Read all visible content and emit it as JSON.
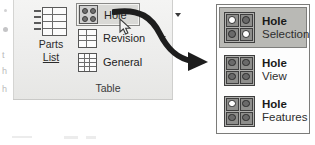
{
  "app": {
    "edge_fragments": [
      "t",
      "h",
      "h"
    ]
  },
  "ribbon": {
    "group_label": "Table",
    "parts_list": {
      "label_line1": "Parts",
      "label_line2": "List",
      "icon": "table-grid-icon"
    },
    "items": [
      {
        "label": "Hole",
        "icon": "hole-matrix-icon",
        "selected": true,
        "has_split_caret": true
      },
      {
        "label": "Revision",
        "icon": "revision-table-icon",
        "selected": false,
        "has_split_caret": true
      },
      {
        "label": "General",
        "icon": "general-table-icon",
        "selected": false,
        "has_split_caret": false
      }
    ]
  },
  "annotation": {
    "arrow": "curved-arrow-icon",
    "cursor": "mouse-pointer-icon"
  },
  "gallery": {
    "items": [
      {
        "title": "Hole",
        "subtitle": "Selection",
        "icon": "hole-selection-icon",
        "highlighted": true,
        "pattern": [
          "hollow",
          "filled",
          "filled",
          "hollow"
        ]
      },
      {
        "title": "Hole",
        "subtitle": "View",
        "icon": "hole-view-icon",
        "highlighted": false,
        "pattern": [
          "filled",
          "filled",
          "filled",
          "filled"
        ]
      },
      {
        "title": "Hole",
        "subtitle": "Features",
        "icon": "hole-features-icon",
        "highlighted": false,
        "pattern": [
          "hollow",
          "filled",
          "filled",
          "filled"
        ]
      }
    ]
  },
  "colors": {
    "ribbon_bg": "#ececeb",
    "selection_bg": "#b9b9b5",
    "icon_stroke": "#3f3f3f",
    "text": "#232323"
  }
}
